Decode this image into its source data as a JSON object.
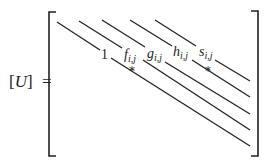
{
  "equation": {
    "lhs_open": "[",
    "lhs_symbol": "U",
    "lhs_close": "]",
    "equals": "="
  },
  "matrix": {
    "diagonals": [
      {
        "name": "main",
        "label": "1",
        "subscript": ""
      },
      {
        "name": "f",
        "label": "f",
        "subscript": "i,j"
      },
      {
        "name": "g",
        "label": "g",
        "subscript": "i,j"
      },
      {
        "name": "h",
        "label": "h",
        "subscript": "i,j"
      },
      {
        "name": "s",
        "label": "s",
        "subscript": "i,j"
      }
    ],
    "markers": [
      {
        "symbol": "*",
        "near": "f-diagonal"
      },
      {
        "symbol": "*",
        "near": "s-diagonal"
      }
    ]
  },
  "colors": {
    "ink": "#222222",
    "background": "#ffffff"
  }
}
